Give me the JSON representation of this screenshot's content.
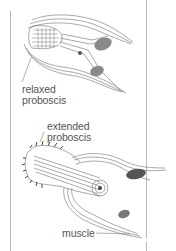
{
  "diagram": {
    "labels": {
      "relaxed_line1": "relaxed",
      "relaxed_line2": "proboscis",
      "extended_line1": "extended",
      "extended_line2": "proboscis",
      "muscle": "muscle"
    },
    "colors": {
      "stroke": "#6e6e6e",
      "dark": "#3a3a3a",
      "frame": "#b8b8b8",
      "text": "#555555"
    }
  }
}
